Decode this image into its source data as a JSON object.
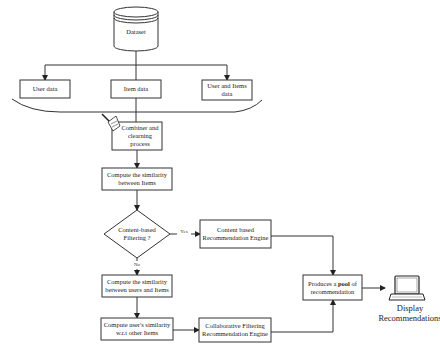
{
  "diagram": {
    "dataset": {
      "label": "Dataset"
    },
    "sources": [
      {
        "label": "User data"
      },
      {
        "label": "Item data"
      },
      {
        "label": "User and Items data"
      }
    ],
    "combiner": {
      "label": "Combiner and clearning process",
      "icon": "broom-icon"
    },
    "item_similarity": {
      "label": "Compute the similarity between Items"
    },
    "decision": {
      "label": "Content-based Filtering ?",
      "yes_label": "Yes",
      "no_label": "No"
    },
    "content_engine": {
      "label": "Content based Recommendation Engine"
    },
    "user_item_similarity": {
      "label": "Compute the similarity between users and Items"
    },
    "user_similarity": {
      "label": "Compute user's similarity w.r.t other Items"
    },
    "collab_engine": {
      "label": "Collaborative Filtering Recommendation Engine"
    },
    "pool": {
      "label_pre": "Produces a ",
      "label_bold": "pool",
      "label_post": " of recommendation"
    },
    "display": {
      "label": "Display Recommendations",
      "icon": "laptop-icon"
    }
  }
}
